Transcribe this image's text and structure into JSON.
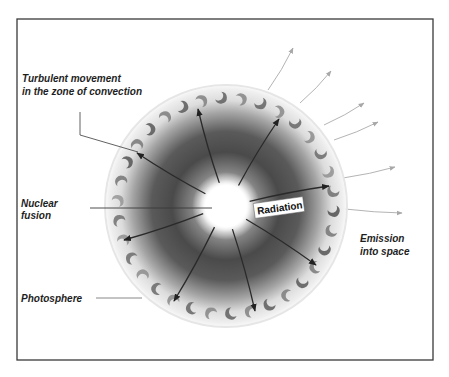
{
  "diagram": {
    "labels": {
      "convection_line1": "Turbulent movement",
      "convection_line2": "in the zone of convection",
      "fusion_line1": "Nuclear",
      "fusion_line2": "fusion",
      "photosphere": "Photosphere",
      "radiation": "Radiation",
      "emission_line1": "Emission",
      "emission_line2": "into space"
    },
    "regions": [
      {
        "name": "core",
        "description": "Nuclear fusion"
      },
      {
        "name": "radiative-zone",
        "description": "Radiation"
      },
      {
        "name": "convection-zone",
        "description": "Turbulent movement in the zone of convection"
      },
      {
        "name": "photosphere",
        "description": "Photosphere"
      }
    ],
    "radiation_arrow_count": 9,
    "emission_arrow_count": 6,
    "colors": {
      "frame": "#3a3a3a",
      "core": "#ffffff",
      "radiative_dark": "#3c3c3c",
      "convection_cells": "#6a6a6a",
      "arrow": "#2a2a2a",
      "emission_arrow": "#b4b4b4",
      "text": "#1e1e1e"
    }
  }
}
